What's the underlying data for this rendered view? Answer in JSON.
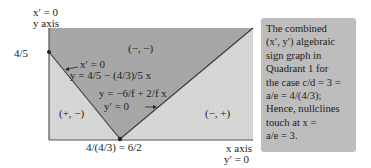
{
  "diagram": {
    "axes": {
      "y_axis_top_label": "x′ = 0",
      "y_axis_name": "y axis",
      "x_axis_name": "x axis",
      "x_axis_bottom_label": "y′ = 0"
    },
    "ticks": {
      "y_intercept": "4/5",
      "x_intercept": "4/(4/3) = 6/2"
    },
    "regions": {
      "top": "(−, −)",
      "left": "(+, −)",
      "right": "(−, +)"
    },
    "nullclines": {
      "x_nullcline_label": "x′ = 0",
      "x_nullcline_eq": "y = 4/5 − (4/3)/5 x",
      "y_nullcline_eq": "y = −6/f + 2/f x",
      "y_nullcline_label": "y′ = 0"
    },
    "colors": {
      "dark_region": "#a9a9a9",
      "light_region": "#d6d6d6",
      "grid_line": "#9a9a9a",
      "axis_line": "#555555",
      "nullcline": "#3a3a3a",
      "infobox_bg": "#bdbdbd"
    }
  },
  "infobox": {
    "lines": [
      "The combined",
      "(x′, y′) algebraic",
      "sign graph in",
      "Quadrant 1 for",
      "the case c/d = 3 =",
      "a/e = 4/(4/3);",
      "Hence, nullclines",
      "touch at x =",
      "a/e = 3."
    ]
  }
}
